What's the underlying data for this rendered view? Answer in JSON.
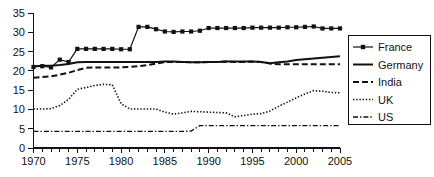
{
  "chart_data": {
    "type": "line",
    "title": "",
    "subtitle": "",
    "xlabel": "",
    "ylabel": "",
    "xlim": [
      1970,
      2005
    ],
    "ylim": [
      0,
      35
    ],
    "ytick_step": 5,
    "xtick_step": 5,
    "x_minor_tick_step": 1,
    "grid": false,
    "legend_position": "right",
    "x": [
      1970,
      1971,
      1972,
      1973,
      1974,
      1975,
      1976,
      1977,
      1978,
      1979,
      1980,
      1981,
      1982,
      1983,
      1984,
      1985,
      1986,
      1987,
      1988,
      1989,
      1990,
      1991,
      1992,
      1993,
      1994,
      1995,
      1996,
      1997,
      1998,
      1999,
      2000,
      2001,
      2002,
      2003,
      2004,
      2005
    ],
    "xticks": [
      1970,
      1975,
      1980,
      1985,
      1990,
      1995,
      2000,
      2005
    ],
    "xtick_labels": [
      "1970",
      "1975",
      "1980",
      "1985",
      "1990",
      "1995",
      "2000",
      "2005"
    ],
    "yticks": [
      0,
      5,
      10,
      15,
      20,
      25,
      30,
      35
    ],
    "ytick_labels": [
      "0",
      "5",
      "10",
      "15",
      "20",
      "25",
      "30",
      "35"
    ],
    "series": [
      {
        "name": "France",
        "style": "line-with-square-markers",
        "color": "#111111",
        "values": [
          21.0,
          21.2,
          20.9,
          22.9,
          22.3,
          25.7,
          25.7,
          25.7,
          25.7,
          25.7,
          25.6,
          25.6,
          31.4,
          31.4,
          30.8,
          30.2,
          30.1,
          30.2,
          30.2,
          30.4,
          31.1,
          31.1,
          31.1,
          31.1,
          31.1,
          31.2,
          31.2,
          31.2,
          31.2,
          31.3,
          31.3,
          31.4,
          31.5,
          31.0,
          31.0,
          31.0
        ]
      },
      {
        "name": "Germany",
        "style": "solid",
        "color": "#111111",
        "values": [
          21.2,
          21.3,
          21.3,
          21.5,
          21.8,
          22.2,
          22.3,
          22.3,
          22.3,
          22.3,
          22.3,
          22.3,
          22.3,
          22.3,
          22.3,
          22.4,
          22.4,
          22.3,
          22.2,
          22.2,
          22.3,
          22.3,
          22.4,
          22.4,
          22.4,
          22.4,
          22.3,
          22.0,
          22.2,
          22.4,
          22.8,
          23.0,
          23.2,
          23.4,
          23.6,
          23.8
        ]
      },
      {
        "name": "India",
        "style": "dashed",
        "color": "#111111",
        "values": [
          18.2,
          18.4,
          18.6,
          19.0,
          19.5,
          20.2,
          20.8,
          20.9,
          20.9,
          20.9,
          20.9,
          21.0,
          21.2,
          21.5,
          21.9,
          22.3,
          22.3,
          22.3,
          22.2,
          22.2,
          22.3,
          22.3,
          22.4,
          22.3,
          22.3,
          22.4,
          22.3,
          21.9,
          21.7,
          21.7,
          21.7,
          21.7,
          21.7,
          21.7,
          21.7,
          21.7
        ]
      },
      {
        "name": "UK",
        "style": "dotted",
        "color": "#111111",
        "values": [
          10.1,
          10.1,
          10.2,
          11.0,
          12.6,
          15.2,
          15.7,
          16.2,
          16.5,
          16.4,
          11.5,
          10.1,
          10.1,
          10.1,
          10.1,
          9.3,
          8.8,
          9.1,
          9.5,
          9.4,
          9.3,
          9.2,
          9.1,
          8.1,
          8.4,
          8.8,
          8.9,
          9.6,
          10.8,
          11.9,
          13.0,
          14.0,
          14.9,
          14.7,
          14.4,
          14.3
        ]
      },
      {
        "name": "US",
        "style": "dash-dot",
        "color": "#111111",
        "values": [
          4.3,
          4.3,
          4.3,
          4.3,
          4.3,
          4.3,
          4.3,
          4.3,
          4.3,
          4.3,
          4.3,
          4.3,
          4.3,
          4.3,
          4.3,
          4.3,
          4.3,
          4.3,
          4.4,
          5.8,
          5.8,
          5.8,
          5.8,
          5.8,
          5.8,
          5.8,
          5.8,
          5.8,
          5.8,
          5.8,
          5.8,
          5.8,
          5.8,
          5.8,
          5.8,
          5.8
        ]
      }
    ]
  },
  "legend": {
    "items": [
      {
        "label": "France",
        "style": "line-with-square-markers"
      },
      {
        "label": "Germany",
        "style": "solid"
      },
      {
        "label": "India",
        "style": "dashed"
      },
      {
        "label": "UK",
        "style": "dotted"
      },
      {
        "label": "US",
        "style": "dash-dot"
      }
    ]
  },
  "colors": {
    "ink": "#111111",
    "background": "#ffffff"
  }
}
